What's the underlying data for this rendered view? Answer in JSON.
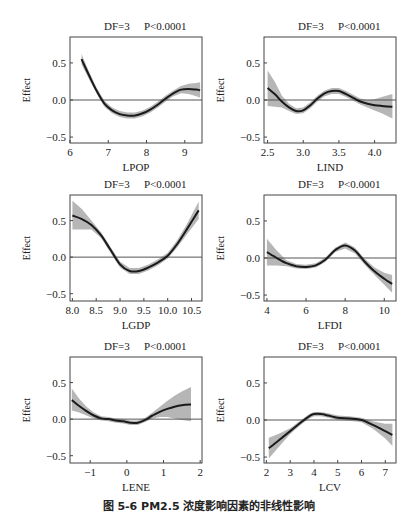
{
  "figure": {
    "caption": "图 5-6 PM2.5 浓度影响因素的非线性影响"
  },
  "colors": {
    "curve": "#1a1a1a",
    "band": "#a9a9a9",
    "zero_line": "#555555",
    "frame": "#444444"
  },
  "chart_data": [
    {
      "type": "line",
      "title": "DF=3    P<0.0001",
      "df": "DF=3",
      "p": "P<0.0001",
      "xlabel": "LPOP",
      "ylabel": "Effect",
      "xlim": [
        6.0,
        9.45
      ],
      "ylim": [
        -0.58,
        0.85
      ],
      "xticks": [
        6,
        7,
        8,
        9
      ],
      "xtick_labels": [
        "6",
        "7",
        "8",
        "9"
      ],
      "yticks": [
        -0.5,
        0.0,
        0.5
      ],
      "ytick_labels": [
        "−0.5",
        "0.0",
        "0.5"
      ],
      "hline": 0.0,
      "x": [
        6.3,
        6.5,
        6.7,
        6.9,
        7.1,
        7.3,
        7.5,
        7.7,
        7.9,
        8.1,
        8.3,
        8.5,
        8.7,
        8.9,
        9.1,
        9.3,
        9.4
      ],
      "y": [
        0.55,
        0.33,
        0.12,
        -0.05,
        -0.14,
        -0.19,
        -0.21,
        -0.21,
        -0.18,
        -0.13,
        -0.06,
        0.02,
        0.09,
        0.14,
        0.15,
        0.14,
        0.13
      ],
      "lower": [
        0.48,
        0.28,
        0.08,
        -0.09,
        -0.18,
        -0.23,
        -0.25,
        -0.25,
        -0.22,
        -0.17,
        -0.1,
        -0.02,
        0.05,
        0.09,
        0.08,
        0.05,
        0.03
      ],
      "upper": [
        0.62,
        0.38,
        0.16,
        -0.01,
        -0.1,
        -0.15,
        -0.17,
        -0.17,
        -0.14,
        -0.09,
        -0.02,
        0.06,
        0.13,
        0.19,
        0.22,
        0.23,
        0.24
      ]
    },
    {
      "type": "line",
      "title": "DF=3    P<0.0001",
      "df": "DF=3",
      "p": "P<0.0001",
      "xlabel": "LIND",
      "ylabel": "Effect",
      "xlim": [
        2.45,
        4.3
      ],
      "ylim": [
        -0.58,
        0.85
      ],
      "xticks": [
        2.5,
        3.0,
        3.5,
        4.0
      ],
      "xtick_labels": [
        "2.5",
        "3.0",
        "3.5",
        "4.0"
      ],
      "yticks": [
        -0.5,
        0.0,
        0.5
      ],
      "ytick_labels": [
        "−0.5",
        "0.0",
        "0.5"
      ],
      "hline": 0.0,
      "x": [
        2.5,
        2.6,
        2.7,
        2.8,
        2.9,
        3.0,
        3.1,
        3.2,
        3.3,
        3.4,
        3.5,
        3.6,
        3.7,
        3.8,
        3.9,
        4.0,
        4.1,
        4.25
      ],
      "y": [
        0.16,
        0.08,
        -0.02,
        -0.1,
        -0.15,
        -0.14,
        -0.07,
        0.02,
        0.09,
        0.12,
        0.12,
        0.08,
        0.03,
        -0.02,
        -0.05,
        -0.07,
        -0.08,
        -0.09
      ],
      "lower": [
        -0.08,
        -0.09,
        -0.1,
        -0.15,
        -0.19,
        -0.18,
        -0.11,
        -0.02,
        0.05,
        0.08,
        0.08,
        0.04,
        -0.01,
        -0.06,
        -0.1,
        -0.14,
        -0.18,
        -0.25
      ],
      "upper": [
        0.4,
        0.25,
        0.06,
        -0.05,
        -0.11,
        -0.1,
        -0.03,
        0.06,
        0.13,
        0.16,
        0.16,
        0.12,
        0.07,
        0.02,
        0.0,
        0.01,
        0.04,
        0.08
      ]
    },
    {
      "type": "line",
      "title": "DF=3    P<0.0001",
      "df": "DF=3",
      "p": "P<0.0001",
      "xlabel": "LGDP",
      "ylabel": "Effect",
      "xlim": [
        7.95,
        10.72
      ],
      "ylim": [
        -0.6,
        0.85
      ],
      "xticks": [
        8.0,
        8.5,
        9.0,
        9.5,
        10.0,
        10.5
      ],
      "xtick_labels": [
        "8.0",
        "8.5",
        "9.0",
        "9.5",
        "10.0",
        "10.5"
      ],
      "yticks": [
        -0.5,
        0.0,
        0.5
      ],
      "ytick_labels": [
        "−0.5",
        "0.0",
        "0.5"
      ],
      "hline": 0.0,
      "x": [
        8.0,
        8.2,
        8.4,
        8.6,
        8.8,
        9.0,
        9.2,
        9.4,
        9.6,
        9.8,
        10.0,
        10.2,
        10.4,
        10.65
      ],
      "y": [
        0.57,
        0.52,
        0.44,
        0.3,
        0.1,
        -0.1,
        -0.19,
        -0.19,
        -0.14,
        -0.07,
        0.02,
        0.18,
        0.38,
        0.64
      ],
      "lower": [
        0.38,
        0.38,
        0.38,
        0.26,
        0.06,
        -0.14,
        -0.23,
        -0.23,
        -0.18,
        -0.11,
        -0.02,
        0.13,
        0.31,
        0.52
      ],
      "upper": [
        0.77,
        0.66,
        0.5,
        0.34,
        0.14,
        -0.06,
        -0.15,
        -0.15,
        -0.1,
        -0.03,
        0.06,
        0.23,
        0.45,
        0.76
      ]
    },
    {
      "type": "line",
      "title": "DF=3    P<0.0001",
      "df": "DF=3",
      "p": "P<0.0001",
      "xlabel": "LFDI",
      "ylabel": "Effect",
      "xlim": [
        3.85,
        10.6
      ],
      "ylim": [
        -0.58,
        0.85
      ],
      "xticks": [
        4,
        6,
        8,
        10
      ],
      "xtick_labels": [
        "4",
        "6",
        "8",
        "10"
      ],
      "yticks": [
        -0.5,
        0.0,
        0.5
      ],
      "ytick_labels": [
        "−0.5",
        "0.0",
        "0.5"
      ],
      "hline": 0.0,
      "x": [
        4.0,
        4.5,
        5.0,
        5.5,
        6.0,
        6.5,
        7.0,
        7.5,
        8.0,
        8.5,
        9.0,
        9.5,
        10.0,
        10.4
      ],
      "y": [
        0.08,
        0.0,
        -0.07,
        -0.11,
        -0.12,
        -0.1,
        -0.02,
        0.11,
        0.17,
        0.1,
        -0.05,
        -0.18,
        -0.28,
        -0.35
      ],
      "lower": [
        -0.1,
        -0.1,
        -0.11,
        -0.14,
        -0.15,
        -0.13,
        -0.05,
        0.08,
        0.13,
        0.06,
        -0.09,
        -0.23,
        -0.36,
        -0.47
      ],
      "upper": [
        0.26,
        0.1,
        -0.03,
        -0.08,
        -0.09,
        -0.07,
        0.01,
        0.14,
        0.21,
        0.14,
        -0.01,
        -0.13,
        -0.2,
        -0.23
      ]
    },
    {
      "type": "line",
      "title": "DF=3    P<0.0001",
      "df": "DF=3",
      "p": "P<0.0001",
      "xlabel": "LENE",
      "ylabel": "Effect",
      "xlim": [
        -1.55,
        2.05
      ],
      "ylim": [
        -0.6,
        0.85
      ],
      "xticks": [
        -1,
        0,
        1,
        2
      ],
      "xtick_labels": [
        "−1",
        "0",
        "1",
        "2"
      ],
      "yticks": [
        -0.5,
        0.0,
        0.5
      ],
      "ytick_labels": [
        "−0.5",
        "0.0",
        "0.5"
      ],
      "hline": 0.0,
      "x": [
        -1.5,
        -1.3,
        -1.1,
        -0.9,
        -0.7,
        -0.5,
        -0.3,
        -0.1,
        0.1,
        0.3,
        0.5,
        0.7,
        0.9,
        1.1,
        1.3,
        1.5,
        1.75
      ],
      "y": [
        0.26,
        0.18,
        0.11,
        0.05,
        0.01,
        0.0,
        -0.02,
        -0.03,
        -0.05,
        -0.05,
        -0.01,
        0.05,
        0.1,
        0.14,
        0.17,
        0.19,
        0.2
      ],
      "lower": [
        0.12,
        0.09,
        0.05,
        0.01,
        -0.02,
        -0.03,
        -0.05,
        -0.06,
        -0.08,
        -0.08,
        -0.04,
        0.01,
        0.03,
        0.03,
        0.01,
        -0.01,
        -0.03
      ],
      "upper": [
        0.42,
        0.28,
        0.17,
        0.09,
        0.04,
        0.03,
        0.01,
        0.0,
        -0.02,
        -0.02,
        0.02,
        0.09,
        0.17,
        0.25,
        0.32,
        0.38,
        0.44
      ]
    },
    {
      "type": "line",
      "title": "DF=3    P<0.0001",
      "df": "DF=3",
      "p": "P<0.0001",
      "xlabel": "LCV",
      "ylabel": "Effect",
      "xlim": [
        1.9,
        7.45
      ],
      "ylim": [
        -0.58,
        0.85
      ],
      "xticks": [
        2,
        3,
        4,
        5,
        6,
        7
      ],
      "xtick_labels": [
        "2",
        "3",
        "4",
        "5",
        "6",
        "7"
      ],
      "yticks": [
        -0.5,
        0.0,
        0.5
      ],
      "ytick_labels": [
        "−0.5",
        "0.0",
        "0.5"
      ],
      "hline": 0.0,
      "x": [
        2.1,
        2.5,
        3.0,
        3.5,
        3.8,
        4.0,
        4.3,
        4.6,
        5.0,
        5.5,
        6.0,
        6.5,
        7.0,
        7.3
      ],
      "y": [
        -0.38,
        -0.28,
        -0.15,
        -0.02,
        0.05,
        0.08,
        0.08,
        0.06,
        0.03,
        0.02,
        0.0,
        -0.07,
        -0.15,
        -0.2
      ],
      "lower": [
        -0.52,
        -0.37,
        -0.19,
        -0.05,
        0.02,
        0.05,
        0.05,
        0.03,
        0.0,
        -0.01,
        -0.03,
        -0.12,
        -0.25,
        -0.35
      ],
      "upper": [
        -0.24,
        -0.19,
        -0.11,
        0.01,
        0.08,
        0.11,
        0.11,
        0.09,
        0.06,
        0.05,
        0.03,
        -0.02,
        -0.05,
        -0.05
      ]
    }
  ]
}
